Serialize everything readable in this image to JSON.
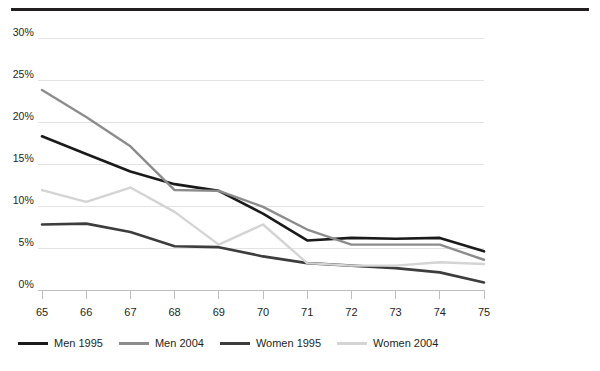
{
  "chart_data": {
    "type": "line",
    "title": "",
    "subtitle": "",
    "xlabel": "",
    "ylabel": "",
    "x": [
      65,
      66,
      67,
      68,
      69,
      70,
      71,
      72,
      73,
      74,
      75
    ],
    "xtick_labels": [
      "65",
      "66",
      "67",
      "68",
      "69",
      "70",
      "71",
      "72",
      "73",
      "74",
      "75"
    ],
    "ytick_labels": [
      "0%",
      "5%",
      "10%",
      "15%",
      "20%",
      "25%",
      "30%"
    ],
    "ytick_values": [
      0,
      5,
      10,
      15,
      20,
      25,
      30
    ],
    "ylim": [
      0,
      30
    ],
    "xlim": [
      65,
      75
    ],
    "grid": "horizontal",
    "legend_position": "bottom-left",
    "series": [
      {
        "name": "Men 1995",
        "color": "#1a1a1a",
        "width": 2.6,
        "values": [
          18.3,
          16.2,
          14.1,
          12.6,
          11.8,
          9.1,
          5.9,
          6.2,
          6.1,
          6.2,
          4.6
        ]
      },
      {
        "name": "Men 2004",
        "color": "#8c8c8c",
        "width": 2.4,
        "values": [
          23.8,
          20.6,
          17.1,
          11.9,
          11.8,
          9.9,
          7.2,
          5.4,
          5.4,
          5.4,
          3.6
        ]
      },
      {
        "name": "Women 1995",
        "color": "#3d3d3d",
        "width": 2.6,
        "values": [
          7.8,
          7.9,
          6.9,
          5.2,
          5.1,
          4.0,
          3.2,
          2.9,
          2.6,
          2.1,
          0.9
        ]
      },
      {
        "name": "Women 2004",
        "color": "#d4d4d4",
        "width": 2.4,
        "values": [
          11.9,
          10.5,
          12.2,
          9.3,
          5.4,
          7.8,
          3.2,
          2.9,
          2.9,
          3.3,
          3.1
        ]
      }
    ]
  },
  "axis": {
    "axis_line_color": "#bdbdbd",
    "grid_color": "#e3e3e3",
    "top_rule_color": "#231f20"
  }
}
